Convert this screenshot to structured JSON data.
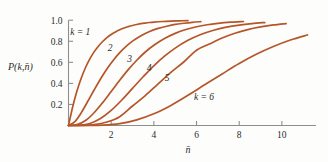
{
  "chart_data": {
    "type": "line",
    "title": "",
    "subtitle": "",
    "xlabel": "n̄",
    "ylabel": "P(k,n̄)",
    "xlim": [
      0,
      11.6
    ],
    "ylim": [
      0,
      1.04
    ],
    "grid": false,
    "legend_position": "inline-curve-labels",
    "x_ticks": [
      2,
      4,
      6,
      8,
      10
    ],
    "x_tick_labels": [
      "2",
      "4",
      "6",
      "8",
      "10"
    ],
    "y_ticks": [
      0.2,
      0.4,
      0.6,
      0.8,
      1.0
    ],
    "y_tick_labels": [
      "0.2",
      "0.4",
      "0.6",
      "0.8",
      "1.0"
    ],
    "curve_color": "#b5562a",
    "axis_color": "#8e8e8e",
    "text_color": "#2b2b2b",
    "annotations": [
      {
        "text": "k = 1",
        "x": 0.55,
        "y": 0.855
      },
      {
        "text": "2",
        "x": 1.95,
        "y": 0.705
      },
      {
        "text": "3",
        "x": 2.86,
        "y": 0.605
      },
      {
        "text": "4",
        "x": 3.78,
        "y": 0.515
      },
      {
        "text": "5",
        "x": 4.62,
        "y": 0.425
      },
      {
        "text": "k = 6",
        "x": 6.35,
        "y": 0.245
      }
    ],
    "series": [
      {
        "name": "k = 1",
        "k": 1,
        "x": [
          0,
          0.2,
          0.4,
          0.6,
          0.8,
          1.0,
          1.2,
          1.4,
          1.6,
          1.8,
          2.0,
          2.2,
          2.4,
          2.6,
          2.8,
          3.0,
          3.2,
          3.4,
          3.6,
          3.8,
          4.0,
          4.4,
          4.8,
          5.2,
          5.6
        ],
        "values": [
          0,
          0.181,
          0.33,
          0.451,
          0.551,
          0.632,
          0.699,
          0.753,
          0.798,
          0.835,
          0.865,
          0.889,
          0.909,
          0.926,
          0.939,
          0.95,
          0.959,
          0.967,
          0.973,
          0.978,
          0.982,
          0.988,
          0.992,
          0.994,
          0.996
        ]
      },
      {
        "name": "2",
        "k": 2,
        "x": [
          0,
          0.3,
          0.6,
          0.9,
          1.2,
          1.5,
          1.8,
          2.1,
          2.4,
          2.7,
          3.0,
          3.4,
          3.8,
          4.2,
          4.6,
          5.0,
          5.4,
          5.8,
          6.2
        ],
        "values": [
          0,
          0.037,
          0.122,
          0.228,
          0.337,
          0.442,
          0.537,
          0.62,
          0.692,
          0.751,
          0.801,
          0.853,
          0.893,
          0.922,
          0.943,
          0.96,
          0.971,
          0.98,
          0.986
        ]
      },
      {
        "name": "3",
        "k": 3,
        "x": [
          0,
          0.4,
          0.8,
          1.2,
          1.6,
          2.0,
          2.4,
          2.8,
          3.2,
          3.6,
          4.0,
          4.5,
          5.0,
          5.5,
          6.0,
          6.5,
          7.0,
          7.6,
          8.2
        ],
        "values": [
          0,
          0.008,
          0.047,
          0.121,
          0.217,
          0.323,
          0.43,
          0.531,
          0.62,
          0.698,
          0.762,
          0.826,
          0.875,
          0.912,
          0.938,
          0.957,
          0.97,
          0.981,
          0.988
        ]
      },
      {
        "name": "4",
        "k": 4,
        "x": [
          0,
          0.5,
          1.0,
          1.5,
          2.0,
          2.5,
          3.0,
          3.5,
          4.0,
          4.5,
          5.0,
          5.6,
          6.2,
          6.8,
          7.4,
          8.0,
          8.6,
          9.2
        ],
        "values": [
          0,
          0.002,
          0.019,
          0.066,
          0.143,
          0.242,
          0.353,
          0.463,
          0.567,
          0.658,
          0.735,
          0.809,
          0.864,
          0.905,
          0.934,
          0.954,
          0.968,
          0.978
        ]
      },
      {
        "name": "5",
        "k": 5,
        "x": [
          0,
          0.6,
          1.2,
          1.8,
          2.4,
          3.0,
          3.6,
          4.2,
          4.8,
          5.4,
          6.0,
          6.6,
          7.2,
          7.8,
          8.4,
          9.0,
          9.6,
          10.2
        ],
        "values": [
          0,
          0.001,
          0.008,
          0.033,
          0.084,
          0.185,
          0.284,
          0.395,
          0.504,
          0.603,
          0.715,
          0.774,
          0.831,
          0.876,
          0.911,
          0.936,
          0.955,
          0.968
        ]
      },
      {
        "name": "k = 6",
        "k": 6,
        "x": [
          0,
          0.8,
          1.6,
          2.4,
          3.2,
          4.0,
          4.8,
          5.6,
          6.4,
          7.2,
          8.0,
          8.8,
          9.6,
          10.4,
          11.2
        ],
        "values": [
          0,
          0.0005,
          0.003,
          0.017,
          0.054,
          0.111,
          0.191,
          0.287,
          0.389,
          0.49,
          0.589,
          0.676,
          0.75,
          0.812,
          0.86
        ]
      }
    ]
  }
}
